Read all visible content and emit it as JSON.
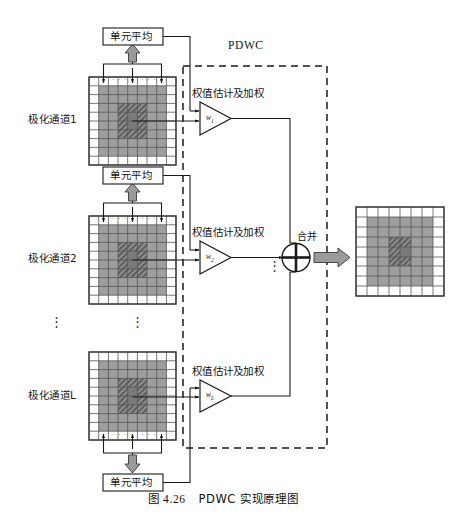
{
  "figure": {
    "caption_prefix": "图 4.26",
    "caption_text": "PDWC 实现原理图",
    "system_label": "PDWC"
  },
  "colors": {
    "page_background": "#ffffff",
    "line": "#1a1a1a",
    "cell_stroke": "#555555",
    "grid_outer": "#ffffff",
    "grid_mid_gray": "#9e9e9e",
    "grid_core_hatch": "#6f6f6f",
    "arrow_fill": "#9a9a9a",
    "dashed_border": "#1a1a1a"
  },
  "channels": [
    {
      "id": "channel-1",
      "label": "极化通道1",
      "avg_box_label": "单元平均",
      "avg_box_position": "above",
      "weight_label": "权值估计及加权",
      "weight_symbol": "w",
      "weight_subscript": "1"
    },
    {
      "id": "channel-2",
      "label": "极化通道2",
      "avg_box_label": "单元平均",
      "avg_box_position": "above",
      "weight_label": "权值估计及加权",
      "weight_symbol": "w",
      "weight_subscript": "2"
    },
    {
      "id": "channel-L",
      "label": "极化通道L",
      "avg_box_label": "单元平均",
      "avg_box_position": "below",
      "weight_label": "权值估计及加权",
      "weight_symbol": "w",
      "weight_subscript": "L"
    }
  ],
  "combiner": {
    "label": "合并",
    "symbol": "plus-circle"
  },
  "ellipsis": {
    "vertical": "⋮",
    "horizontal": "· · ·"
  },
  "grid_spec": {
    "input_cols": 9,
    "input_rows": 10,
    "output_cols": 8,
    "output_rows": 9,
    "gray_band_note": "middle gray ring inside outer white border",
    "core_note": "dark hatched core block at center"
  }
}
